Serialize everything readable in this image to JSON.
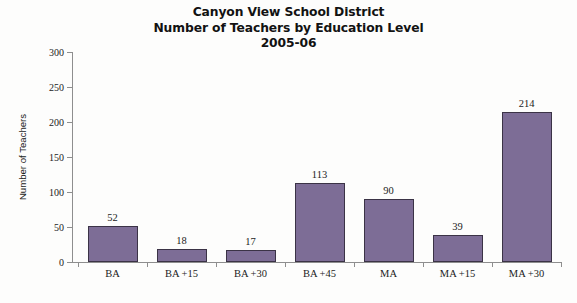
{
  "chart_data": {
    "type": "bar",
    "title": "Canyon View School District Number of Teachers by Education Level 2005-06",
    "title_lines": [
      "Canyon View School District",
      "Number of Teachers by Education Level",
      "2005-06"
    ],
    "categories": [
      "BA",
      "BA +15",
      "BA +30",
      "BA +45",
      "MA",
      "MA +15",
      "MA +30"
    ],
    "values": [
      52,
      18,
      17,
      113,
      90,
      39,
      214
    ],
    "xlabel": "",
    "ylabel": "Number of Teachers",
    "ylim": [
      0,
      300
    ],
    "yticks": [
      0,
      50,
      100,
      150,
      200,
      250,
      300
    ],
    "ytick_labels": [
      "0",
      "50",
      "100",
      "150",
      "200",
      "250",
      "300"
    ],
    "grid": false,
    "legend": false,
    "data_labels": [
      "52",
      "18",
      "17",
      "113",
      "90",
      "39",
      "214"
    ],
    "bar_color": "#7d6d96",
    "bar_edge_color": "#3b3346",
    "axis_color": "#8e8e8e",
    "text_color": "#1b1b1b",
    "background": "#fdfdfc"
  }
}
